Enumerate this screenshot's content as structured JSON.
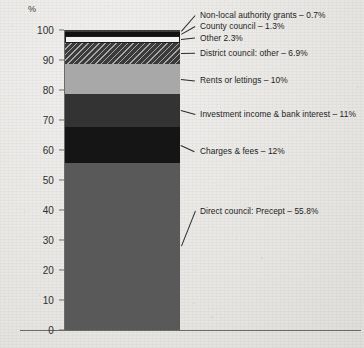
{
  "chart_data": {
    "type": "bar",
    "subtype": "stacked-single-bar",
    "title": "",
    "xlabel": "",
    "ylabel": "%",
    "ylim": [
      0,
      100
    ],
    "ytick_labels": [
      "0",
      "10",
      "20",
      "30",
      "40",
      "50",
      "60",
      "70",
      "80",
      "90",
      "100"
    ],
    "ytick_values": [
      0,
      10,
      20,
      30,
      40,
      50,
      60,
      70,
      80,
      90,
      100
    ],
    "grid": false,
    "legend_position": "callout-right",
    "categories": [
      "Income sources"
    ],
    "series": [
      {
        "name": "Direct council: Precept",
        "values": [
          55.8
        ],
        "label": "Direct council: Precept – 55.8%",
        "color": "#595959",
        "pattern": "solid"
      },
      {
        "name": "Charges & fees",
        "values": [
          12
        ],
        "label": "Charges & fees – 12%",
        "color": "#151515",
        "pattern": "solid"
      },
      {
        "name": "Investment income & bank interest",
        "values": [
          11
        ],
        "label": "Investment income & bank interest – 11%",
        "color": "#333333",
        "pattern": "solid"
      },
      {
        "name": "Rents or lettings",
        "values": [
          10
        ],
        "label": "Rents or lettings – 10%",
        "color": "#a8a8a8",
        "pattern": "solid"
      },
      {
        "name": "District council: other",
        "values": [
          6.9
        ],
        "label": "District council: other – 6.9%",
        "color": "#3b3b3b",
        "pattern": "diagonal-hatch"
      },
      {
        "name": "Other",
        "values": [
          2.3
        ],
        "label": "Other 2.3%",
        "color": "#f2f1ef",
        "pattern": "solid-outlined"
      },
      {
        "name": "County council",
        "values": [
          1.3
        ],
        "label": "County council – 1.3%",
        "color": "#111111",
        "pattern": "solid"
      },
      {
        "name": "Non-local authority grants",
        "values": [
          0.7
        ],
        "label": "Non-local authority grants – 0.7%",
        "color": "#3d3d3d",
        "pattern": "solid"
      }
    ]
  },
  "axis": {
    "unit_symbol": "%",
    "ticks": [
      {
        "label": "100",
        "value": 100
      },
      {
        "label": "90",
        "value": 90
      },
      {
        "label": "80",
        "value": 80
      },
      {
        "label": "70",
        "value": 70
      },
      {
        "label": "60",
        "value": 60
      },
      {
        "label": "50",
        "value": 50
      },
      {
        "label": "40",
        "value": 40
      },
      {
        "label": "30",
        "value": 30
      },
      {
        "label": "20",
        "value": 20
      },
      {
        "label": "10",
        "value": 10
      },
      {
        "label": "0",
        "value": 0
      }
    ]
  },
  "callouts": [
    {
      "id": "non-local-authority-grants",
      "text": "Non-local authority grants – 0.7%",
      "x": 200,
      "y": 10
    },
    {
      "id": "county-council",
      "text": "County council – 1.3%",
      "x": 200,
      "y": 21
    },
    {
      "id": "other",
      "text": "Other 2.3%",
      "x": 200,
      "y": 33
    },
    {
      "id": "district-council-other",
      "text": "District council: other – 6.9%",
      "x": 200,
      "y": 48
    },
    {
      "id": "rents-or-lettings",
      "text": "Rents or lettings – 10%",
      "x": 200,
      "y": 75
    },
    {
      "id": "investment-income-bank-interest",
      "text": "Investment income & bank interest – 11%",
      "x": 200,
      "y": 109
    },
    {
      "id": "charges-fees",
      "text": "Charges & fees – 12%",
      "x": 200,
      "y": 146
    },
    {
      "id": "direct-council-precept",
      "text": "Direct council: Precept – 55.8%",
      "x": 200,
      "y": 206
    }
  ],
  "colors": {
    "background": "#e9e8e5",
    "axis": "#6b6b6b",
    "text": "#1d1d1d",
    "precept": "#595959",
    "charges": "#151515",
    "investment": "#333333",
    "rents": "#a8a8a8",
    "district_other": "#3b3b3b",
    "other": "#f2f1ef",
    "county_council": "#111111",
    "non_local_grants": "#3d3d3d"
  }
}
